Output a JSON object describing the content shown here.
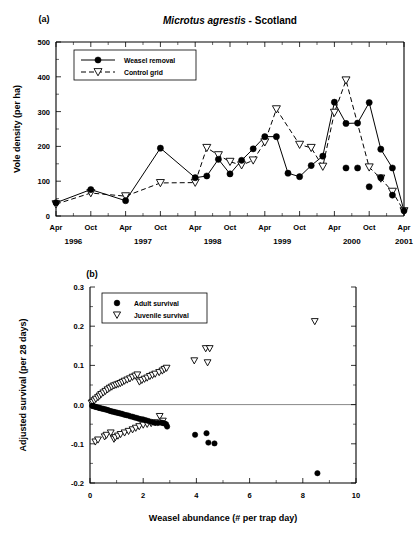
{
  "figure": {
    "panel_a_label": "(a)",
    "panel_b_label": "(b)"
  },
  "chart_data": [
    {
      "type": "line",
      "panel": "(a)",
      "title": "Microtus agrestis - Scotland",
      "title_italic_part": "Microtus agrestis",
      "title_plain_part": " - Scotland",
      "xlabel": "",
      "ylabel": "Vole density (per ha)",
      "ylim": [
        0,
        500
      ],
      "yticks": [
        0,
        100,
        200,
        300,
        400,
        500
      ],
      "ytick_labels": [
        "0",
        "100",
        "200",
        "300",
        "400",
        "500"
      ],
      "xlim": [
        0,
        60
      ],
      "xtick_labels": [
        "Apr",
        "Oct",
        "Apr",
        "Oct",
        "Apr",
        "Oct",
        "Apr",
        "Oct",
        "Apr",
        "Oct",
        "Apr"
      ],
      "xtick_positions": [
        0,
        6,
        12,
        18,
        24,
        30,
        36,
        42,
        48,
        54,
        60
      ],
      "year_labels": [
        "1996",
        "1997",
        "1998",
        "1999",
        "2000",
        "2001"
      ],
      "year_positions": [
        3,
        15,
        27,
        39,
        51,
        60
      ],
      "grid": false,
      "legend_position": "top-left",
      "series": [
        {
          "name": "Weasel removal",
          "marker": "filled-circle",
          "line": "solid",
          "x": [
            0,
            6,
            12,
            18,
            24,
            26,
            28,
            30,
            32,
            34,
            36,
            38,
            40,
            42,
            44,
            46,
            48,
            50,
            52,
            54,
            56,
            58,
            60
          ],
          "values": [
            38,
            76,
            44,
            195,
            110,
            115,
            163,
            121,
            160,
            193,
            228,
            228,
            123,
            113,
            145,
            172,
            327,
            266,
            267,
            326,
            192,
            138,
            15
          ]
        },
        {
          "name": "Control grid",
          "marker": "open-triangle",
          "line": "dashed",
          "x": [
            0,
            6,
            12,
            18,
            24,
            26,
            28,
            30,
            32,
            34,
            36,
            38,
            42,
            44,
            46,
            48,
            50,
            54,
            56,
            58,
            60
          ],
          "values": [
            34,
            66,
            57,
            95,
            96,
            196,
            175,
            156,
            146,
            160,
            212,
            307,
            205,
            196,
            142,
            297,
            390,
            140,
            108,
            70,
            14
          ]
        }
      ],
      "extra_points": {
        "weasel_removal_tail": {
          "x": [
            50,
            52,
            54,
            56,
            58
          ],
          "values": [
            138,
            138,
            84,
            110,
            60
          ]
        }
      }
    },
    {
      "type": "scatter",
      "panel": "(b)",
      "title": "",
      "xlabel": "Weasel abundance (# per trap day)",
      "ylabel": "Adjusted survival (per 28 days)",
      "xlim": [
        0,
        10
      ],
      "ylim": [
        -0.2,
        0.3
      ],
      "xticks": [
        0,
        2,
        4,
        6,
        8,
        10
      ],
      "xtick_labels": [
        "0",
        "2",
        "4",
        "6",
        "8",
        "10"
      ],
      "yticks": [
        -0.2,
        -0.1,
        0.0,
        0.1,
        0.2,
        0.3
      ],
      "ytick_labels": [
        "-0.2",
        "-0.1",
        "0.0",
        "0.1",
        "0.2",
        "0.3"
      ],
      "grid": false,
      "zero_line": true,
      "legend_position": "top-left",
      "series": [
        {
          "name": "Adult survival",
          "marker": "filled-circle",
          "x": [
            0.08,
            0.12,
            0.18,
            0.22,
            0.28,
            0.33,
            0.38,
            0.44,
            0.5,
            0.56,
            0.62,
            0.68,
            0.74,
            0.8,
            0.86,
            0.92,
            0.98,
            1.04,
            1.1,
            1.16,
            1.22,
            1.3,
            1.38,
            1.45,
            1.52,
            1.6,
            1.68,
            1.76,
            1.84,
            1.92,
            2.0,
            2.1,
            2.2,
            2.3,
            2.42,
            2.55,
            2.68,
            2.74,
            2.8,
            2.86,
            2.9,
            3.95,
            4.38,
            4.45,
            4.68,
            8.55
          ],
          "values": [
            -0.003,
            -0.004,
            -0.005,
            -0.006,
            -0.007,
            -0.008,
            -0.009,
            -0.01,
            -0.011,
            -0.012,
            -0.013,
            -0.014,
            -0.016,
            -0.017,
            -0.018,
            -0.019,
            -0.02,
            -0.021,
            -0.022,
            -0.023,
            -0.024,
            -0.026,
            -0.027,
            -0.028,
            -0.03,
            -0.031,
            -0.033,
            -0.034,
            -0.036,
            -0.037,
            -0.038,
            -0.04,
            -0.042,
            -0.044,
            -0.046,
            -0.047,
            -0.046,
            -0.047,
            -0.048,
            -0.05,
            -0.056,
            -0.077,
            -0.073,
            -0.097,
            -0.099,
            -0.175
          ]
        },
        {
          "name": "Juvenile survival",
          "marker": "open-triangle",
          "x": [
            0.06,
            0.1,
            0.16,
            0.22,
            0.3,
            0.36,
            0.42,
            0.5,
            0.58,
            0.66,
            0.74,
            0.82,
            0.9,
            0.98,
            1.06,
            1.14,
            1.22,
            1.3,
            1.4,
            1.5,
            1.6,
            1.7,
            1.78,
            1.86,
            1.95,
            2.05,
            2.15,
            2.25,
            2.35,
            2.45,
            2.6,
            2.72,
            2.8,
            2.88,
            0.2,
            0.3,
            0.55,
            0.62,
            0.78,
            0.9,
            0.95,
            1.05,
            1.15,
            1.3,
            1.45,
            1.6,
            1.72,
            1.85,
            2.0,
            2.15,
            2.3,
            2.45,
            2.62,
            2.74,
            3.92,
            4.35,
            4.5,
            4.42,
            8.45
          ],
          "values": [
            0.004,
            0.006,
            0.01,
            0.014,
            0.018,
            0.022,
            0.026,
            0.03,
            0.034,
            0.038,
            0.042,
            0.045,
            0.048,
            0.05,
            0.052,
            0.054,
            0.057,
            0.06,
            0.063,
            0.066,
            0.07,
            0.073,
            0.076,
            0.058,
            0.062,
            0.065,
            0.068,
            0.072,
            0.075,
            0.078,
            0.082,
            0.086,
            0.09,
            0.093,
            -0.095,
            -0.09,
            -0.082,
            -0.078,
            -0.072,
            -0.088,
            -0.084,
            -0.08,
            -0.076,
            -0.072,
            -0.068,
            -0.064,
            -0.06,
            -0.056,
            -0.052,
            -0.05,
            -0.048,
            -0.046,
            -0.03,
            -0.042,
            0.112,
            0.143,
            0.143,
            0.107,
            0.212
          ]
        }
      ]
    }
  ]
}
